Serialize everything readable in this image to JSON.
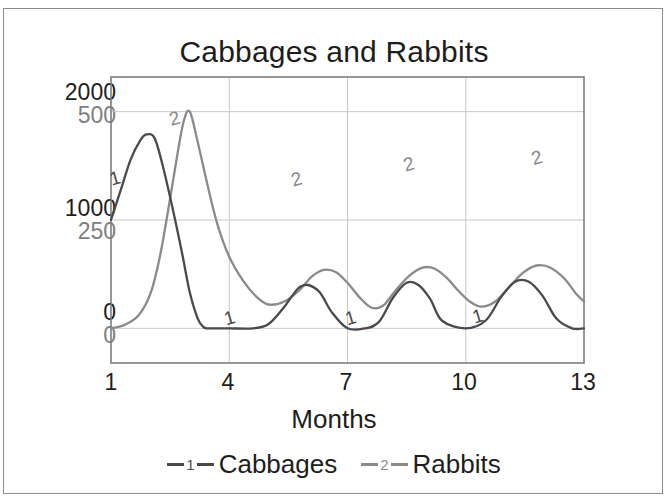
{
  "chart_data": {
    "type": "line",
    "title": "Cabbages and Rabbits",
    "xlabel": "Months",
    "ylabel": "",
    "grid": true,
    "legend_position": "bottom",
    "xlim": [
      1,
      13
    ],
    "xticks": [
      1,
      4,
      7,
      10,
      13
    ],
    "xtick_labels": [
      "1",
      "4",
      "7",
      "10",
      "13"
    ],
    "y_axes": [
      {
        "name": "Cabbages",
        "ticks": [
          0,
          1000,
          2000
        ],
        "tick_labels": [
          "0",
          "1000",
          "2000"
        ],
        "ylim": [
          -320,
          2320
        ],
        "color": "#4a4a4a"
      },
      {
        "name": "Rabbits",
        "ticks": [
          0,
          250,
          500
        ],
        "tick_labels": [
          "0",
          "250",
          "500"
        ],
        "ylim": [
          -80,
          580
        ],
        "color": "#8a8a8a"
      }
    ],
    "series": [
      {
        "name": "Cabbages",
        "marker_label": "1",
        "axis": "left-primary",
        "color": "#4a4a4a",
        "x": [
          1.0,
          1.25,
          1.5,
          1.75,
          1.9,
          2.1,
          2.3,
          2.55,
          2.8,
          3.0,
          3.2,
          3.35,
          3.5,
          4.0,
          4.6,
          5.0,
          5.4,
          5.75,
          6.0,
          6.3,
          6.6,
          7.0,
          7.45,
          7.8,
          8.15,
          8.5,
          8.8,
          9.1,
          9.4,
          10.0,
          10.5,
          10.9,
          11.25,
          11.6,
          11.95,
          12.3,
          12.7,
          13.0
        ],
        "y": [
          1000,
          1280,
          1560,
          1740,
          1790,
          1760,
          1520,
          1130,
          700,
          330,
          90,
          10,
          0,
          0,
          0,
          40,
          200,
          370,
          400,
          330,
          150,
          0,
          0,
          60,
          280,
          420,
          400,
          270,
          70,
          0,
          70,
          290,
          430,
          430,
          300,
          90,
          0,
          0
        ]
      },
      {
        "name": "Rabbits",
        "marker_label": "2",
        "axis": "left-secondary",
        "color": "#8a8a8a",
        "x": [
          1.0,
          1.35,
          1.7,
          2.0,
          2.25,
          2.5,
          2.7,
          2.85,
          3.0,
          3.2,
          3.45,
          3.7,
          4.0,
          4.35,
          4.7,
          5.0,
          5.4,
          5.8,
          6.1,
          6.4,
          6.7,
          7.0,
          7.3,
          7.6,
          7.9,
          8.2,
          8.55,
          8.9,
          9.2,
          9.5,
          9.8,
          10.1,
          10.4,
          10.75,
          11.1,
          11.45,
          11.8,
          12.15,
          12.5,
          12.8,
          13.0
        ],
        "y": [
          0,
          8,
          30,
          80,
          170,
          300,
          410,
          480,
          500,
          430,
          330,
          240,
          165,
          110,
          72,
          55,
          62,
          90,
          120,
          135,
          130,
          105,
          72,
          48,
          52,
          85,
          120,
          140,
          138,
          118,
          88,
          62,
          50,
          62,
          95,
          128,
          145,
          140,
          115,
          80,
          62
        ]
      }
    ],
    "inline_markers": [
      {
        "series": "Cabbages",
        "label": "1",
        "x": 1.15,
        "y": 1330
      },
      {
        "series": "Rabbits",
        "label": "2",
        "x": 2.66,
        "y": 470
      },
      {
        "series": "Cabbages",
        "label": "1",
        "x": 4.05,
        "y": 40
      },
      {
        "series": "Rabbits",
        "label": "2",
        "x": 5.75,
        "y": 330
      },
      {
        "series": "Cabbages",
        "label": "1",
        "x": 7.12,
        "y": 40
      },
      {
        "series": "Rabbits",
        "label": "2",
        "x": 8.6,
        "y": 365
      },
      {
        "series": "Cabbages",
        "label": "1",
        "x": 10.35,
        "y": 55
      },
      {
        "series": "Rabbits",
        "label": "2",
        "x": 11.85,
        "y": 380
      }
    ]
  },
  "chart": {
    "title": "Cabbages and Rabbits",
    "xaxis_title": "Months",
    "ytick_primary": [
      "2000",
      "1000",
      "0"
    ],
    "ytick_secondary": [
      "500",
      "250",
      "0"
    ],
    "xticks": [
      "1",
      "4",
      "7",
      "10",
      "13"
    ]
  },
  "legend": {
    "items": [
      {
        "marker": "1",
        "label": "Cabbages",
        "color": "#4a4a4a"
      },
      {
        "marker": "2",
        "label": "Rabbits",
        "color": "#8a8a8a"
      }
    ]
  },
  "colors": {
    "cabbages": "#4a4a4a",
    "rabbits": "#8a8a8a",
    "axis": "#6f6f6f",
    "grid": "#c8c8c8",
    "frame": "#8d8d8d",
    "text": "#1d1d1d",
    "text_secondary": "#808080"
  }
}
